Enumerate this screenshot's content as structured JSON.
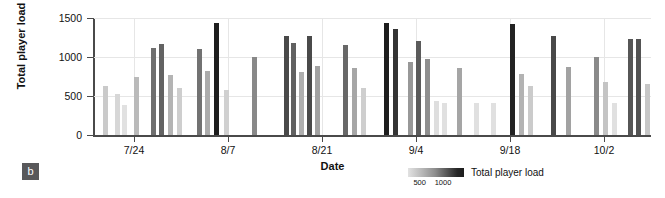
{
  "panel": {
    "label": "b"
  },
  "axes": {
    "ylabel": "Total player load",
    "xlabel": "Date",
    "yticks": [
      0,
      500,
      1000,
      1500
    ],
    "ytick_labels": [
      "0",
      "500",
      "1000",
      "1500"
    ],
    "xtick_labels": [
      "7/24",
      "8/7",
      "8/21",
      "9/4",
      "9/18",
      "10/2"
    ]
  },
  "legend": {
    "title": "Total player load",
    "tick_labels": [
      "500",
      "1000"
    ],
    "ticks": [
      500,
      1000
    ],
    "gradient_low_color": "#e2e2e2",
    "gradient_high_color": "#1c1c1c"
  },
  "chart_data": {
    "type": "bar",
    "title": "",
    "xlabel": "Date",
    "ylabel": "Total player load",
    "ylim": [
      0,
      1500
    ],
    "xlim": [
      0,
      557
    ],
    "grid": true,
    "legend_position": "bottom-right",
    "colormap": "grayscale-by-value",
    "xtick_labels": [
      "7/24",
      "8/7",
      "8/21",
      "9/4",
      "9/18",
      "10/2"
    ],
    "xtick_positions": [
      40,
      134,
      228,
      322,
      416,
      510
    ],
    "yticks": [
      0,
      500,
      1000,
      1500
    ],
    "note": "Bar fill shade is mapped to the bar's own value: light gray at ~400, near-black at ~1400.",
    "bars": [
      {
        "x": 9,
        "value": 630
      },
      {
        "x": 21,
        "value": 520
      },
      {
        "x": 28,
        "value": 385
      },
      {
        "x": 40,
        "value": 740
      },
      {
        "x": 57,
        "value": 1120
      },
      {
        "x": 65,
        "value": 1170
      },
      {
        "x": 74,
        "value": 775
      },
      {
        "x": 83,
        "value": 600
      },
      {
        "x": 103,
        "value": 1105
      },
      {
        "x": 111,
        "value": 820
      },
      {
        "x": 120,
        "value": 1435
      },
      {
        "x": 130,
        "value": 580
      },
      {
        "x": 158,
        "value": 1005
      },
      {
        "x": 190,
        "value": 1275
      },
      {
        "x": 197,
        "value": 1180
      },
      {
        "x": 205,
        "value": 805
      },
      {
        "x": 213,
        "value": 1270
      },
      {
        "x": 221,
        "value": 880
      },
      {
        "x": 249,
        "value": 1150
      },
      {
        "x": 258,
        "value": 855
      },
      {
        "x": 267,
        "value": 600
      },
      {
        "x": 290,
        "value": 1440
      },
      {
        "x": 299,
        "value": 1355
      },
      {
        "x": 314,
        "value": 930
      },
      {
        "x": 322,
        "value": 1205
      },
      {
        "x": 331,
        "value": 975
      },
      {
        "x": 340,
        "value": 440
      },
      {
        "x": 348,
        "value": 415
      },
      {
        "x": 363,
        "value": 860
      },
      {
        "x": 380,
        "value": 410
      },
      {
        "x": 397,
        "value": 415
      },
      {
        "x": 416,
        "value": 1420
      },
      {
        "x": 425,
        "value": 780
      },
      {
        "x": 434,
        "value": 625
      },
      {
        "x": 457,
        "value": 1275
      },
      {
        "x": 472,
        "value": 875
      },
      {
        "x": 500,
        "value": 1000
      },
      {
        "x": 509,
        "value": 675
      },
      {
        "x": 518,
        "value": 410
      },
      {
        "x": 534,
        "value": 1225
      },
      {
        "x": 542,
        "value": 1235
      },
      {
        "x": 551,
        "value": 650
      }
    ]
  }
}
